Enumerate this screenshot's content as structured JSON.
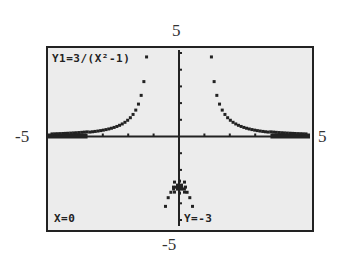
{
  "window": {
    "xmin": "-5",
    "xmax": "5",
    "ymin": "-5",
    "ymax": "5"
  },
  "screen": {
    "equation": "Y1=3/(X²-1)",
    "cursor_x": "X=0",
    "cursor_y": "Y=-3",
    "bg_color": "#ececec",
    "ink_color": "#222222"
  },
  "chart_data": {
    "type": "scatter",
    "title": "Y1=3/(X²-1)",
    "function": "3/(x^2-1)",
    "xlabel": "",
    "ylabel": "",
    "xlim": [
      -5,
      5
    ],
    "ylim": [
      -5,
      5
    ],
    "x_tick_labels": [
      "-5",
      "5"
    ],
    "y_tick_labels": [
      "-5",
      "5"
    ],
    "grid": false,
    "trace_point": {
      "x": 0,
      "y": -3
    },
    "annotations": [
      "X=0",
      "Y=-3"
    ],
    "vertical_asymptotes": [
      -1,
      1
    ],
    "horizontal_asymptote": 0
  }
}
